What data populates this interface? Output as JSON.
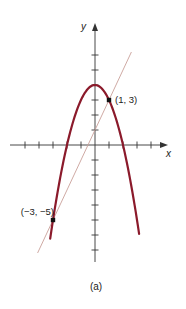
{
  "figure": {
    "caption": "(a)",
    "axes": {
      "x_label": "x",
      "y_label": "y",
      "origin_px": [
        95,
        145
      ],
      "x_unit_px": 14,
      "y_unit_px": 15,
      "x_ticks": [
        -5,
        -4,
        -3,
        -2,
        -1,
        1,
        2,
        3,
        4
      ],
      "y_ticks": [
        -7,
        -6,
        -5,
        -4,
        -3,
        -2,
        -1,
        1,
        2,
        3,
        4,
        5,
        6
      ]
    },
    "curves": [
      {
        "name": "parabola",
        "equation": "y = 4 - x^2",
        "color": "#8b1a2b",
        "x_range": [
          -3.2,
          3.15
        ]
      },
      {
        "name": "line",
        "equation": "y = 2x + 1",
        "color": "#c9a09a",
        "x_range": [
          -4.1,
          2.6
        ]
      }
    ],
    "points": [
      {
        "label": "(1, 3)",
        "x": 1,
        "y": 3
      },
      {
        "label": "(−3, −5)",
        "x": -3,
        "y": -5
      }
    ]
  }
}
